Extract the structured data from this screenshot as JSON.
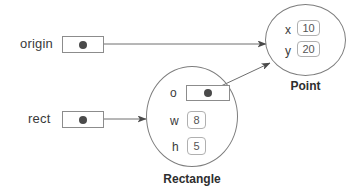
{
  "diagram": {
    "type": "object-reference-diagram",
    "background_color": "#ffffff",
    "stroke_color": "#7d7d7d",
    "text_color": "#3a3a3a",
    "dot_color": "#4a4a4a",
    "value_border_color": "#b0b0b0"
  },
  "variables": [
    {
      "name": "origin",
      "label": "origin",
      "box_kind": "reference-box",
      "points_to": "Point"
    },
    {
      "name": "rect",
      "label": "rect",
      "box_kind": "reference-box",
      "points_to": "Rectangle"
    }
  ],
  "objects": [
    {
      "id": "point",
      "caption": "Point",
      "attributes": [
        {
          "name": "x",
          "value": "10",
          "kind": "value"
        },
        {
          "name": "y",
          "value": "20",
          "kind": "value"
        }
      ]
    },
    {
      "id": "rectangle",
      "caption": "Rectangle",
      "attributes": [
        {
          "name": "o",
          "value": "",
          "kind": "reference",
          "points_to": "Point"
        },
        {
          "name": "w",
          "value": "8",
          "kind": "value"
        },
        {
          "name": "h",
          "value": "5",
          "kind": "value"
        }
      ]
    }
  ],
  "arrows": [
    {
      "name": "origin-to-point",
      "from": "origin-ref-box",
      "to": "point-object"
    },
    {
      "name": "rect-to-rectangle",
      "from": "rect-ref-box",
      "to": "rectangle-object"
    },
    {
      "name": "rectangle-o-to-point",
      "from": "rectangle-o-ref-box",
      "to": "point-object"
    }
  ]
}
